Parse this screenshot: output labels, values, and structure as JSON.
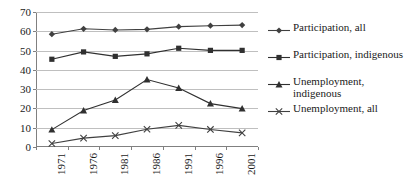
{
  "chart_data": {
    "type": "line",
    "title": "",
    "subtitle": "",
    "xlabel": "",
    "ylabel": "",
    "categories": [
      "1971",
      "1976",
      "1981",
      "1986",
      "1991",
      "1996",
      "2001"
    ],
    "ylim": [
      0,
      70
    ],
    "y_ticks": [
      0,
      10,
      20,
      30,
      40,
      50,
      60,
      70
    ],
    "grid": true,
    "legend_position": "right",
    "series": [
      {
        "name": "Participation, all",
        "marker": "diamond",
        "color": "#404040",
        "values": [
          58.5,
          61.3,
          60.7,
          61.0,
          62.4,
          62.9,
          63.2
        ]
      },
      {
        "name": "Participation, indigenous",
        "marker": "square",
        "color": "#303030",
        "values": [
          45.5,
          49.3,
          47.0,
          48.3,
          51.2,
          50.1,
          50.1
        ]
      },
      {
        "name": "Unemployment,\nindigenous",
        "marker": "triangle",
        "color": "#303030",
        "values": [
          9.0,
          18.9,
          24.4,
          35.0,
          30.6,
          22.5,
          19.9
        ]
      },
      {
        "name": "Unemployment, all",
        "marker": "x",
        "color": "#404040",
        "values": [
          1.8,
          4.6,
          5.9,
          9.2,
          11.2,
          9.1,
          7.3
        ]
      }
    ]
  },
  "axes": {
    "y_tick_labels": [
      "0",
      "10",
      "20",
      "30",
      "40",
      "50",
      "60",
      "70"
    ],
    "x_tick_labels": [
      "1971",
      "1976",
      "1981",
      "1986",
      "1991",
      "1996",
      "2001"
    ]
  },
  "legend": {
    "items": [
      {
        "label": "Participation, all",
        "marker": "diamond-marker-icon"
      },
      {
        "label": "Participation, indigenous",
        "marker": "square-marker-icon"
      },
      {
        "label": "Unemployment,\nindigenous",
        "marker": "triangle-marker-icon"
      },
      {
        "label": "Unemployment, all",
        "marker": "x-marker-icon"
      }
    ]
  },
  "colors": {
    "line": "#404040",
    "grid": "#bfbfbf",
    "axis": "#808080",
    "text": "#1a1a1a",
    "background": "#ffffff"
  }
}
